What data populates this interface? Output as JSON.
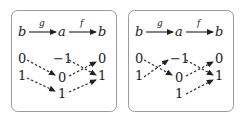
{
  "panels": [
    {
      "id": "left",
      "top_row": {
        "source": "b",
        "middle": "a",
        "target": "b",
        "first_map": "g",
        "second_map": "f"
      },
      "left_column": [
        "0",
        "1"
      ],
      "middle_column": [
        "-1",
        "0",
        "1"
      ],
      "right_column": [
        "0",
        "1"
      ],
      "mappings": [
        {
          "from": "left:0",
          "to": "middle:0"
        },
        {
          "from": "left:1",
          "to": "middle:1"
        },
        {
          "from": "middle:-1",
          "to": "right:1"
        },
        {
          "from": "middle:0",
          "to": "right:0"
        },
        {
          "from": "middle:1",
          "to": "right:1"
        }
      ]
    },
    {
      "id": "right",
      "top_row": {
        "source": "b",
        "middle": "a",
        "target": "b",
        "first_map": "g",
        "second_map": "f"
      },
      "left_column": [
        "0",
        "1"
      ],
      "middle_column": [
        "-1",
        "0",
        "1"
      ],
      "right_column": [
        "0",
        "1"
      ],
      "mappings": [
        {
          "from": "left:0",
          "to": "middle:0"
        },
        {
          "from": "left:1",
          "to": "middle:-1"
        },
        {
          "from": "middle:-1",
          "to": "right:1"
        },
        {
          "from": "middle:0",
          "to": "right:0"
        },
        {
          "from": "middle:1",
          "to": "right:1"
        }
      ]
    }
  ],
  "labels": {
    "b": "b",
    "a": "a",
    "g": "g",
    "f": "f",
    "zero": "0",
    "one": "1",
    "neg_one": "−1"
  }
}
